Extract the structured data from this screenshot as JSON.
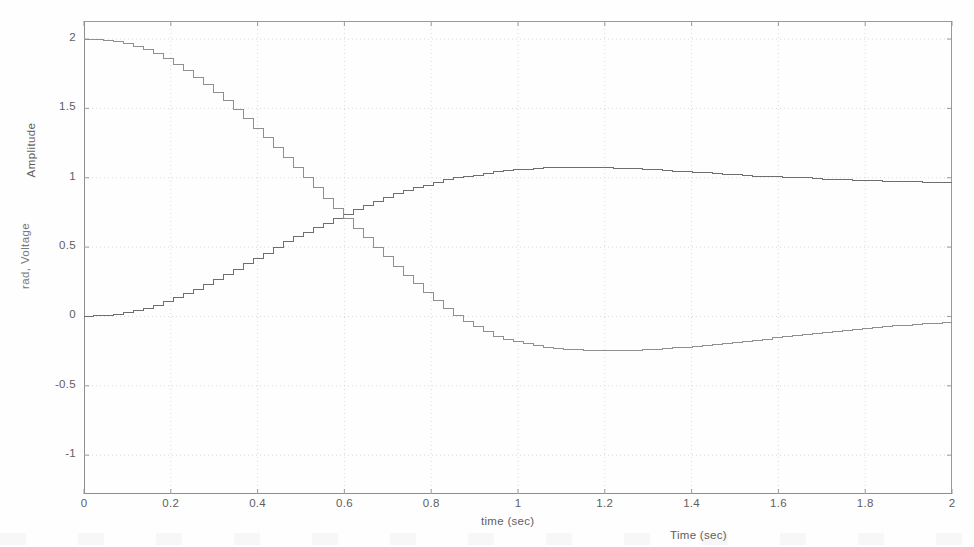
{
  "figure": {
    "background_color": "#fefefe",
    "axis_color": "#8e8e8e",
    "grid_color": "#cfcfcf",
    "text_color": "#5e5e5e"
  },
  "axes": {
    "primary_ylabel": "Amplitude",
    "secondary_ylabel": "rad, Voltage",
    "primary_xlabel": "time (sec)",
    "secondary_xlabel": "Time (sec)",
    "yticks": [
      "2",
      "1.5",
      "1",
      "0.5",
      "0",
      "-0.5",
      "-1"
    ],
    "ytick_values": [
      2,
      1.5,
      1,
      0.5,
      0,
      -0.5,
      -1
    ],
    "xticks": [
      "0",
      "0.2",
      "0.4",
      "0.6",
      "0.8",
      "1",
      "1.2",
      "1.4",
      "1.6",
      "1.8",
      "2"
    ],
    "xtick_values": [
      0,
      0.2,
      0.4,
      0.6,
      0.8,
      1,
      1.2,
      1.4,
      1.6,
      1.8,
      2
    ]
  },
  "chart_data": {
    "type": "line",
    "title": "",
    "xlabel": "time (sec)",
    "ylabel": "Amplitude",
    "xlim": [
      0,
      2
    ],
    "ylim": [
      -1.28,
      2.13
    ],
    "grid": true,
    "grid_style": "dotted",
    "legend": "none",
    "sample_step": 0.023,
    "rendering": "staircase (zero-order hold) sampled data, thin gray lines",
    "series": [
      {
        "name": "step response (rising)",
        "color": "#6e6e6e",
        "style": "stairs",
        "x": [
          0.0,
          0.05,
          0.1,
          0.15,
          0.2,
          0.25,
          0.3,
          0.35,
          0.4,
          0.45,
          0.5,
          0.55,
          0.6,
          0.65,
          0.7,
          0.75,
          0.8,
          0.85,
          0.9,
          0.95,
          1.0,
          1.05,
          1.1,
          1.15,
          1.2,
          1.25,
          1.3,
          1.35,
          1.4,
          1.45,
          1.5,
          1.55,
          1.6,
          1.65,
          1.7,
          1.75,
          1.8,
          1.85,
          1.9,
          1.95,
          2.0
        ],
        "y": [
          0.0,
          0.01,
          0.03,
          0.07,
          0.13,
          0.19,
          0.27,
          0.35,
          0.43,
          0.52,
          0.6,
          0.67,
          0.74,
          0.81,
          0.87,
          0.92,
          0.96,
          1.0,
          1.02,
          1.05,
          1.06,
          1.07,
          1.075,
          1.075,
          1.07,
          1.065,
          1.06,
          1.05,
          1.04,
          1.03,
          1.02,
          1.01,
          1.005,
          1.0,
          0.99,
          0.985,
          0.98,
          0.975,
          0.97,
          0.968,
          0.967
        ]
      },
      {
        "name": "control effort / error (falling)",
        "color": "#8f8f8f",
        "style": "stairs",
        "x": [
          0.0,
          0.05,
          0.1,
          0.15,
          0.2,
          0.25,
          0.3,
          0.35,
          0.4,
          0.45,
          0.5,
          0.55,
          0.6,
          0.65,
          0.7,
          0.75,
          0.8,
          0.85,
          0.9,
          0.95,
          1.0,
          1.05,
          1.1,
          1.15,
          1.2,
          1.25,
          1.3,
          1.35,
          1.4,
          1.45,
          1.5,
          1.55,
          1.6,
          1.65,
          1.7,
          1.75,
          1.8,
          1.85,
          1.9,
          1.95,
          2.0
        ],
        "y": [
          2.0,
          1.99,
          1.96,
          1.91,
          1.83,
          1.73,
          1.61,
          1.48,
          1.33,
          1.18,
          1.02,
          0.86,
          0.7,
          0.55,
          0.4,
          0.26,
          0.13,
          0.01,
          -0.08,
          -0.15,
          -0.19,
          -0.22,
          -0.235,
          -0.245,
          -0.248,
          -0.245,
          -0.238,
          -0.228,
          -0.215,
          -0.2,
          -0.185,
          -0.168,
          -0.15,
          -0.132,
          -0.115,
          -0.1,
          -0.085,
          -0.072,
          -0.06,
          -0.05,
          -0.043
        ]
      }
    ]
  }
}
